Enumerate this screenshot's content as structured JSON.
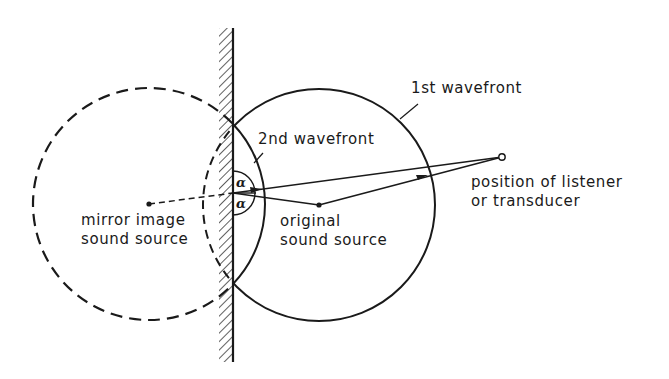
{
  "diagram": {
    "type": "sound-reflection-mirror-image",
    "labels": {
      "first_wavefront": "1st wavefront",
      "second_wavefront": "2nd wavefront",
      "mirror_source_line1": "mirror image",
      "mirror_source_line2": "sound source",
      "original_source_line1": "original",
      "original_source_line2": "sound source",
      "listener_line1": "position of listener",
      "listener_line2": "or transducer",
      "angle_symbol": "α"
    },
    "elements": {
      "wall": {
        "x": 233,
        "y_top": 28,
        "y_bottom": 362,
        "style": "hatched-left"
      },
      "original_source": {
        "x": 319,
        "y": 205
      },
      "mirror_source": {
        "x": 149,
        "y": 204
      },
      "listener": {
        "x": 502,
        "y": 157
      },
      "reflection_point": {
        "x": 233,
        "y": 193
      },
      "first_wavefront_circle": {
        "cx": 319,
        "cy": 205,
        "r": 116
      },
      "second_wavefront_circle": {
        "cx": 149,
        "cy": 204,
        "r": 116
      }
    },
    "colors": {
      "ink": "#1a1a1a",
      "background": "#ffffff"
    }
  }
}
